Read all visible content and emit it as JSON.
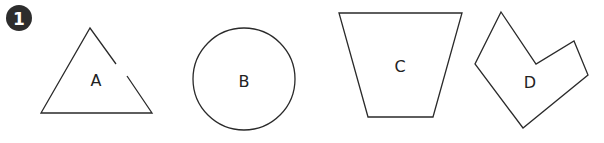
{
  "question": {
    "number": "1",
    "badge_color": "#2d2d2d"
  },
  "shapes": [
    {
      "label": "A",
      "type": "triangle",
      "note": "open (gap in right side)"
    },
    {
      "label": "B",
      "type": "circle"
    },
    {
      "label": "C",
      "type": "trapezoid"
    },
    {
      "label": "D",
      "type": "concave hexagon"
    }
  ],
  "colors": {
    "stroke": "#2a2a2a",
    "background": "#ffffff"
  }
}
